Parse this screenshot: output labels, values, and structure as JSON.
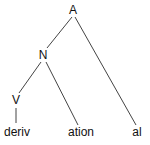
{
  "diagram": {
    "type": "tree",
    "nodes": [
      {
        "id": "A",
        "label": "A",
        "x": 73,
        "y": 14
      },
      {
        "id": "N",
        "label": "N",
        "x": 43,
        "y": 59
      },
      {
        "id": "V",
        "label": "V",
        "x": 16,
        "y": 104
      },
      {
        "id": "deriv",
        "label": "deriv",
        "x": 17,
        "y": 136
      },
      {
        "id": "ation",
        "label": "ation",
        "x": 81,
        "y": 136
      },
      {
        "id": "al",
        "label": "al",
        "x": 137,
        "y": 136
      }
    ],
    "edges": [
      {
        "from": "A",
        "to": "N"
      },
      {
        "from": "A",
        "to": "al"
      },
      {
        "from": "N",
        "to": "V"
      },
      {
        "from": "N",
        "to": "ation"
      },
      {
        "from": "V",
        "to": "deriv"
      }
    ],
    "colors": {
      "line": "#444444",
      "text": "#111111",
      "background": "#ffffff"
    }
  }
}
